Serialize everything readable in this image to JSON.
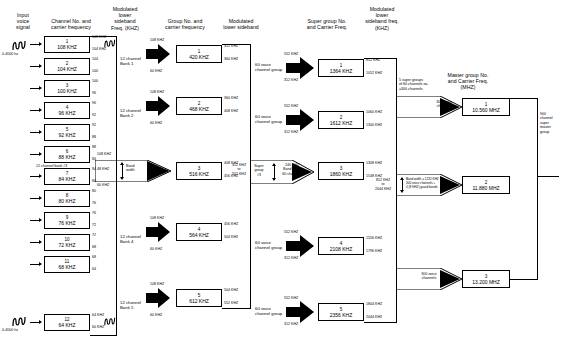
{
  "headers": {
    "input_signal": "Input\nvoice\nsignal",
    "channel_carrier": "Channel No. and\ncarrier frequency",
    "mod_lsb_freq": "Modulated\nlower\nsideband\nFreq. (KHZ)",
    "group_carrier": "Group No. and\ncarrier frequency",
    "mod_lsb": "Modulated\nlower sideband",
    "super_group_carrier": "Super group No.\nand Carrier Freq.",
    "mod_lsb_sg": "Modulated\nlower\nsideband freq.\n(KHZ)",
    "master_group_carrier": "Master group No.\nand Carrier Freq.\n(MHZ)"
  },
  "input": {
    "top_range": "0-4000 hz",
    "bottom_range": "0-4000 hz"
  },
  "channels": [
    {
      "no": "1",
      "freq": "108 KHZ",
      "top": "108 KHZ",
      "bot": "104 KHZ"
    },
    {
      "no": "2",
      "freq": "104 KHZ",
      "top": "104",
      "bot": "100"
    },
    {
      "no": "3",
      "freq": "100 KHZ",
      "top": "100",
      "bot": "96"
    },
    {
      "no": "4",
      "freq": "96 KHZ",
      "top": "96",
      "bot": "92"
    },
    {
      "no": "5",
      "freq": "92 KHZ",
      "top": "92",
      "bot": "88"
    },
    {
      "no": "6",
      "freq": "88 KHZ",
      "top": "88",
      "bot": "84"
    },
    {
      "no": "7",
      "freq": "84 KHZ",
      "top": "84",
      "bot": "80"
    },
    {
      "no": "8",
      "freq": "80 KHZ",
      "top": "80",
      "bot": "76"
    },
    {
      "no": "9",
      "freq": "76 KHZ",
      "top": "76",
      "bot": "72"
    },
    {
      "no": "10",
      "freq": "72 KHZ",
      "top": "72",
      "bot": "68"
    },
    {
      "no": "11",
      "freq": "68 KHZ",
      "top": "68",
      "bot": "64"
    },
    {
      "no": "12",
      "freq": "64 KHZ",
      "top": "64 KHZ",
      "bot": "60 KHZ"
    }
  ],
  "channel_bank_note": "12 channel bank #3",
  "banks": [
    {
      "label": "12 channel\nBank 1",
      "top": "108 KHZ",
      "bot": "60 KHZ"
    },
    {
      "label": "12 channel\nBank 2",
      "top": "108 KHZ",
      "bot": "60 KHZ"
    },
    {
      "label": "12 channel\nBank 4",
      "top": "108 KHZ",
      "bot": "60 KHZ"
    },
    {
      "label": "12 channel\nBank 5",
      "top": "108 KHZ",
      "bot": "60 KHZ"
    }
  ],
  "bank3": {
    "top": "108 KHZ",
    "bot": "60 KHZ",
    "left": "48 KHZ",
    "caption": "Band\nwidth"
  },
  "groups": [
    {
      "no": "1",
      "freq": "420 KHZ",
      "top": "312 KHZ",
      "bot": "360 KHZ"
    },
    {
      "no": "2",
      "freq": "468 KHZ",
      "top": "360 KHZ",
      "bot": "408 KHZ"
    },
    {
      "no": "3",
      "freq": "516 KHZ",
      "top": "408 KHZ",
      "bot": "456 KHZ"
    },
    {
      "no": "4",
      "freq": "564 KHZ",
      "top": "456 KHZ",
      "bot": "504 KHZ"
    },
    {
      "no": "5",
      "freq": "612 KHZ",
      "top": "504 KHZ",
      "bot": "552 KHZ"
    }
  ],
  "group_feeds": [
    {
      "label": "60 voice\nchannel group",
      "top": "552 KHZ",
      "bot": "312 KHZ"
    },
    {
      "label": "60 voice\nchannel group",
      "top": "552 KHZ",
      "bot": "312 KHZ"
    },
    {
      "label": "60 voice\nchannel group",
      "top": "552 KHZ",
      "bot": "312 KHZ"
    },
    {
      "label": "60 voice\nchannel group",
      "top": "552 KHZ",
      "bot": "312 KHZ"
    }
  ],
  "supergroup3_feed": {
    "range": "312 KHZ\nto\n552 KHZ",
    "name": "Super\ngroup\n#3",
    "caption": "240 KHZ\nBand width\n60 channels"
  },
  "supergroups": [
    {
      "no": "1",
      "freq": "1364 KHZ",
      "top": "812 KHZ",
      "bot": "1052 KHZ"
    },
    {
      "no": "2",
      "freq": "1612 KHZ",
      "top": "1060 KHZ",
      "bot": "1300 KHZ"
    },
    {
      "no": "3",
      "freq": "1860 KHZ",
      "top": "1308 KHZ",
      "bot": "1548 KHZ"
    },
    {
      "no": "4",
      "freq": "2108 KHZ",
      "top": "1556 KHZ",
      "bot": "1796 KHZ"
    },
    {
      "no": "5",
      "freq": "2356 KHZ",
      "top": "1804 KHZ",
      "bot": "2044 KHZ"
    }
  ],
  "mastergroup_feeds": {
    "top": {
      "note": "5 super groups\nof 60 channels ea.\n=300 channels",
      "caption": "300 voice\nchannels"
    },
    "middle": {
      "range": "812 KHZ\nto\n2044 KHZ",
      "caption": "Band width = 1232 KHZ\n300 voice channels +\n4 (8 KHZ) guard bands"
    },
    "bottom": {
      "caption": "300 voice\nchannels"
    }
  },
  "mastergroups": [
    {
      "no": "1",
      "freq": "10.560 MHZ"
    },
    {
      "no": "2",
      "freq": "11.880 MHZ"
    },
    {
      "no": "3",
      "freq": "13.200 MHZ"
    }
  ],
  "output": {
    "label": "900\nchannel\nsuper\nmaster\ngroup"
  }
}
